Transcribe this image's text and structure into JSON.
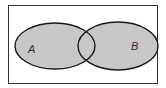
{
  "diagram": {
    "type": "venn",
    "shaded_region": "A union B",
    "sets": [
      {
        "label": "A",
        "cx": 55,
        "cy": 46,
        "rx": 40,
        "ry": 23
      },
      {
        "label": "B",
        "cx": 118,
        "cy": 46,
        "rx": 40,
        "ry": 24
      }
    ],
    "universe": {
      "x": 8,
      "y": 5,
      "width": 150,
      "height": 79
    },
    "colors": {
      "fill": "#c8c8c8",
      "stroke": "#1a1a1a",
      "frame": "#333333",
      "background": "#ffffff"
    }
  }
}
